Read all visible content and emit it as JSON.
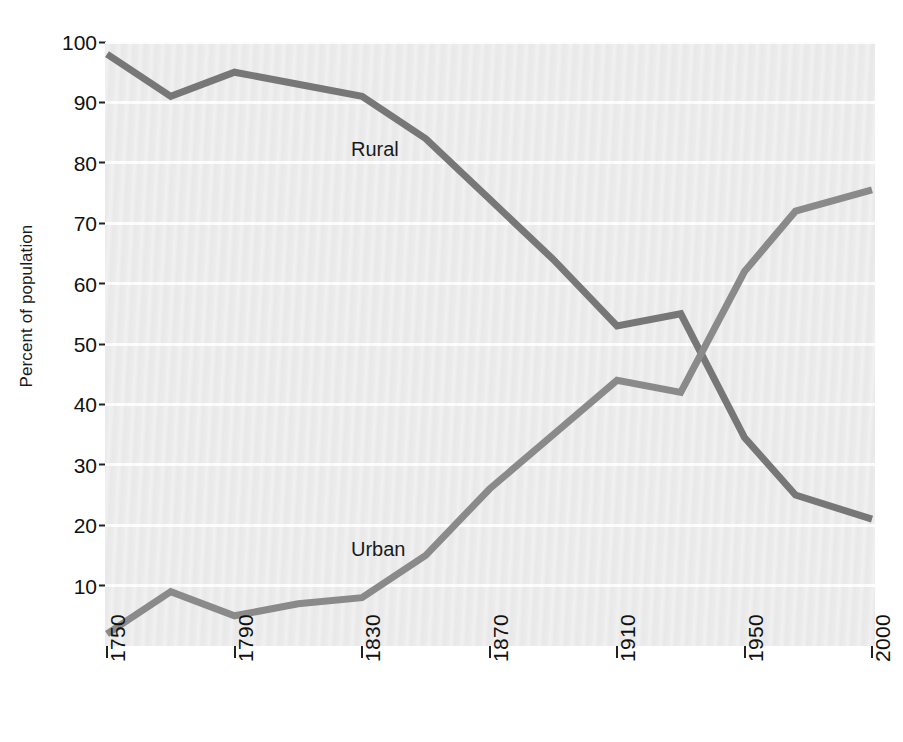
{
  "chart_data": {
    "type": "line",
    "title": "",
    "subtitle": "",
    "xlabel": "",
    "ylabel": "Percent of population",
    "x": [
      1750,
      1770,
      1790,
      1810,
      1830,
      1850,
      1870,
      1890,
      1910,
      1930,
      1950,
      1970,
      2000
    ],
    "xticks": [
      1750,
      1790,
      1830,
      1870,
      1910,
      1950,
      2000
    ],
    "xtick_labels": [
      "1750",
      "1790",
      "1830",
      "1870",
      "1910",
      "1950",
      "2000"
    ],
    "yticks": [
      10,
      20,
      30,
      40,
      50,
      60,
      70,
      80,
      90,
      100
    ],
    "ytick_labels": [
      "10",
      "20",
      "30",
      "40",
      "50",
      "60",
      "70",
      "80",
      "90",
      "100"
    ],
    "xlim": [
      1750,
      2000
    ],
    "ylim": [
      0,
      100
    ],
    "grid": "horizontal",
    "legend_position": "inline-annotations",
    "series": [
      {
        "name": "Rural",
        "label": "Rural",
        "color": "#777777",
        "values": [
          98,
          91,
          95,
          93,
          91,
          84,
          74,
          64,
          53,
          55,
          34.5,
          25,
          21
        ]
      },
      {
        "name": "Urban",
        "label": "Urban",
        "color": "#8a8a8a",
        "values": [
          2,
          9,
          5,
          7,
          8,
          15,
          26,
          35,
          44,
          42,
          62,
          72,
          75.5
        ]
      }
    ],
    "annotations": [
      {
        "text": "Rural",
        "x": 1800,
        "y": 85
      },
      {
        "text": "Urban",
        "x": 1800,
        "y": 15
      }
    ],
    "plot_background": "#ebebeb",
    "gridline_color": "#fdfdfd",
    "figure_background": "#ffffff"
  },
  "axis": {
    "y_title": "Percent of population"
  }
}
